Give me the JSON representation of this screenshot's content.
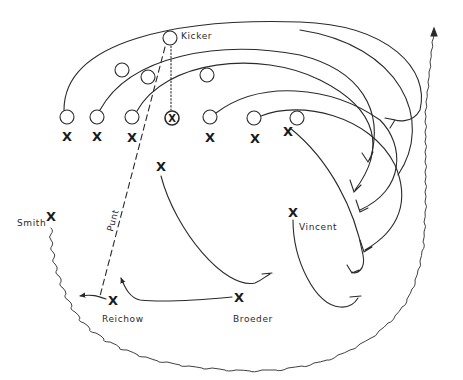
{
  "diagram": {
    "stroke_color": "#2a2a2a",
    "labels": {
      "kicker": "Kicker",
      "smith": "Smith",
      "vincent": "Vincent",
      "reichow": "Reichow",
      "broeder": "Broeder",
      "punt": "Punt"
    },
    "marks": {
      "offense_symbol": "O",
      "defense_symbol": "X",
      "center_symbol": "⊗"
    },
    "offense_players": [
      {
        "id": "kicker",
        "x": 170,
        "y": 38
      },
      {
        "id": "back-1",
        "x": 122,
        "y": 70
      },
      {
        "id": "back-2",
        "x": 148,
        "y": 77
      },
      {
        "id": "back-3",
        "x": 207,
        "y": 75
      },
      {
        "id": "line-1",
        "x": 67,
        "y": 117
      },
      {
        "id": "line-2",
        "x": 97,
        "y": 117
      },
      {
        "id": "line-3",
        "x": 132,
        "y": 117
      },
      {
        "id": "center",
        "x": 172,
        "y": 118
      },
      {
        "id": "line-5",
        "x": 210,
        "y": 117
      },
      {
        "id": "line-6",
        "x": 254,
        "y": 118
      },
      {
        "id": "line-7",
        "x": 297,
        "y": 118
      }
    ],
    "defense_players": [
      {
        "id": "d-line-1",
        "x": 67,
        "y": 136
      },
      {
        "id": "d-line-2",
        "x": 97,
        "y": 136
      },
      {
        "id": "d-line-3",
        "x": 132,
        "y": 137
      },
      {
        "id": "d-line-5",
        "x": 210,
        "y": 137
      },
      {
        "id": "d-line-6",
        "x": 255,
        "y": 138
      },
      {
        "id": "d-line-7",
        "x": 288,
        "y": 131
      },
      {
        "id": "linebacker",
        "x": 161,
        "y": 166
      },
      {
        "id": "smith",
        "x": 51,
        "y": 216
      },
      {
        "id": "vincent",
        "x": 293,
        "y": 212
      },
      {
        "id": "reichow",
        "x": 113,
        "y": 300
      },
      {
        "id": "broeder",
        "x": 239,
        "y": 297
      }
    ]
  }
}
